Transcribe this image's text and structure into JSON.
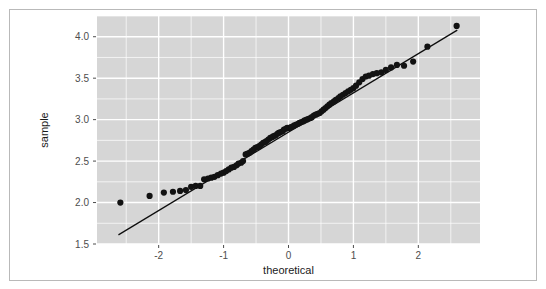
{
  "figure": {
    "kind": "qq-plot",
    "background_color": "#ffffff",
    "frame_color": "#b9b9b9",
    "panel_color": "#d6d6d6",
    "grid_color": "#ffffff",
    "point_color": "#121212",
    "line_color": "#0d0d0d"
  },
  "chart_data": {
    "type": "scatter",
    "title": "",
    "subtitle": "",
    "xlabel": "theoretical",
    "ylabel": "sample",
    "xlim": [
      -2.95,
      2.95
    ],
    "ylim": [
      1.5,
      4.25
    ],
    "xticks": [
      -2,
      -1,
      0,
      1,
      2
    ],
    "xticklabels": [
      "-2",
      "-1",
      "0",
      "1",
      "2"
    ],
    "yticks": [
      1.5,
      2.0,
      2.5,
      3.0,
      3.5,
      4.0
    ],
    "yticklabels": [
      "1.5",
      "2.0",
      "2.5",
      "3.0",
      "3.5",
      "4.0"
    ],
    "x_minor_ticks": [
      -2.5,
      -1.5,
      -0.5,
      0.5,
      1.5,
      2.5
    ],
    "y_minor_ticks": [
      1.75,
      2.25,
      2.75,
      3.25,
      3.75,
      4.25
    ],
    "grid": true,
    "legend": null,
    "annotations": [],
    "series": [
      {
        "name": "sample quantiles",
        "type": "scatter",
        "marker": "circle",
        "marker_size": 3.1,
        "color": "#121212",
        "x": [
          -2.59,
          -2.14,
          -1.92,
          -1.78,
          -1.67,
          -1.58,
          -1.5,
          -1.43,
          -1.36,
          -1.3,
          -1.24,
          -1.19,
          -1.14,
          -1.09,
          -1.04,
          -1.0,
          -0.96,
          -0.92,
          -0.88,
          -0.84,
          -0.8,
          -0.77,
          -0.73,
          -0.7,
          -0.66,
          -0.63,
          -0.6,
          -0.57,
          -0.54,
          -0.51,
          -0.48,
          -0.45,
          -0.42,
          -0.39,
          -0.36,
          -0.34,
          -0.31,
          -0.28,
          -0.25,
          -0.23,
          -0.2,
          -0.17,
          -0.15,
          -0.12,
          -0.09,
          -0.07,
          -0.04,
          -0.02,
          0.02,
          0.04,
          0.07,
          0.09,
          0.12,
          0.15,
          0.17,
          0.2,
          0.23,
          0.25,
          0.28,
          0.31,
          0.34,
          0.36,
          0.39,
          0.42,
          0.45,
          0.48,
          0.51,
          0.54,
          0.57,
          0.6,
          0.63,
          0.66,
          0.7,
          0.73,
          0.77,
          0.8,
          0.84,
          0.88,
          0.92,
          0.96,
          1.0,
          1.04,
          1.09,
          1.14,
          1.19,
          1.24,
          1.3,
          1.36,
          1.43,
          1.5,
          1.58,
          1.67,
          1.78,
          1.92,
          2.14,
          2.59
        ],
        "y": [
          2.0,
          2.08,
          2.12,
          2.13,
          2.14,
          2.15,
          2.19,
          2.2,
          2.2,
          2.28,
          2.29,
          2.3,
          2.31,
          2.33,
          2.35,
          2.36,
          2.38,
          2.4,
          2.42,
          2.43,
          2.45,
          2.47,
          2.48,
          2.5,
          2.58,
          2.59,
          2.6,
          2.62,
          2.64,
          2.66,
          2.67,
          2.68,
          2.7,
          2.72,
          2.73,
          2.74,
          2.76,
          2.78,
          2.79,
          2.8,
          2.81,
          2.83,
          2.84,
          2.85,
          2.86,
          2.88,
          2.89,
          2.9,
          2.9,
          2.91,
          2.92,
          2.93,
          2.94,
          2.95,
          2.96,
          2.97,
          2.98,
          2.99,
          3.0,
          3.01,
          3.02,
          3.03,
          3.05,
          3.06,
          3.07,
          3.08,
          3.1,
          3.12,
          3.14,
          3.16,
          3.18,
          3.2,
          3.22,
          3.24,
          3.26,
          3.28,
          3.3,
          3.32,
          3.34,
          3.36,
          3.38,
          3.41,
          3.45,
          3.49,
          3.52,
          3.53,
          3.55,
          3.56,
          3.57,
          3.6,
          3.63,
          3.66,
          3.65,
          3.7,
          3.88,
          4.13
        ]
      },
      {
        "name": "reference line",
        "type": "line",
        "color": "#0d0d0d",
        "x": [
          -2.62,
          2.6
        ],
        "y": [
          1.61,
          4.08
        ]
      }
    ]
  },
  "axes": {
    "x_axis_title": "theoretical",
    "y_axis_title": "sample"
  }
}
